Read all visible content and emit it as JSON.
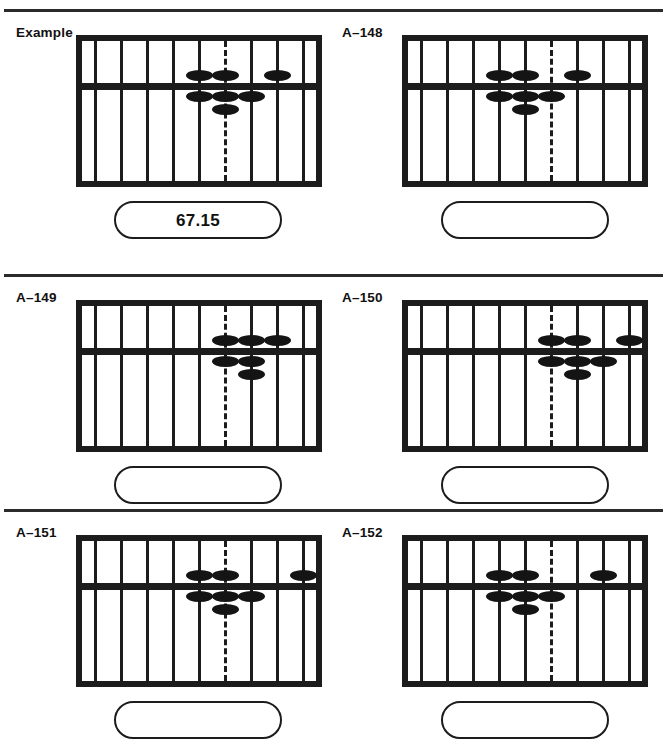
{
  "page": {
    "separator_color": "#2b2b2b",
    "frame_color": "#1c1c1c",
    "bead_color": "#141414"
  },
  "soroban_spec": {
    "rod_count": 9,
    "decimal_rod_index": 6,
    "decimal_rod_style": "dashed",
    "upper_deck_beads_per_rod": 1,
    "lower_deck_beads_per_rod": 4,
    "bead_shape": "flattened-ellipse"
  },
  "problems": [
    {
      "label": "Example",
      "answer": "67.15",
      "answer_placeholder": "",
      "upper_beads": [
        5,
        6,
        8
      ],
      "lower_beads": [
        {
          "rod": 5,
          "count": 1
        },
        {
          "rod": 6,
          "count": 2
        },
        {
          "rod": 7,
          "count": 1
        }
      ]
    },
    {
      "label": "A–148",
      "answer": "",
      "answer_placeholder": "",
      "upper_beads": [
        4,
        5,
        7
      ],
      "lower_beads": [
        {
          "rod": 4,
          "count": 1
        },
        {
          "rod": 5,
          "count": 2
        },
        {
          "rod": 6,
          "count": 1
        }
      ]
    },
    {
      "label": "A–149",
      "answer": "",
      "answer_placeholder": "",
      "upper_beads": [
        6,
        7,
        8
      ],
      "lower_beads": [
        {
          "rod": 6,
          "count": 1
        },
        {
          "rod": 7,
          "count": 2
        }
      ]
    },
    {
      "label": "A–150",
      "answer": "",
      "answer_placeholder": "",
      "upper_beads": [
        6,
        7,
        9
      ],
      "lower_beads": [
        {
          "rod": 6,
          "count": 1
        },
        {
          "rod": 7,
          "count": 2
        },
        {
          "rod": 8,
          "count": 1
        }
      ]
    },
    {
      "label": "A–151",
      "answer": "",
      "answer_placeholder": "",
      "upper_beads": [
        5,
        6,
        9
      ],
      "lower_beads": [
        {
          "rod": 5,
          "count": 1
        },
        {
          "rod": 6,
          "count": 2
        },
        {
          "rod": 7,
          "count": 1
        }
      ]
    },
    {
      "label": "A–152",
      "answer": "",
      "answer_placeholder": "",
      "upper_beads": [
        4,
        5,
        8
      ],
      "lower_beads": [
        {
          "rod": 4,
          "count": 1
        },
        {
          "rod": 5,
          "count": 2
        },
        {
          "rod": 6,
          "count": 1
        }
      ]
    }
  ]
}
